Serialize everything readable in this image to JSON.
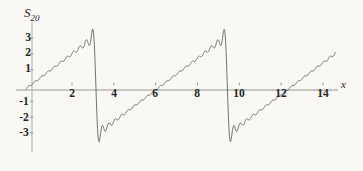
{
  "figure": {
    "background_color": "#f9f8f5",
    "curve_color": "#5a5a5a",
    "axis_color": "#8d8d8d",
    "y_axis_title_main": "S",
    "y_axis_title_sub": "20",
    "x_axis_title": "x"
  },
  "chart_data": {
    "type": "line",
    "title": "",
    "subtitle": "",
    "xlabel": "x",
    "ylabel": "S_20",
    "xlim": [
      -0.35,
      14.9
    ],
    "ylim": [
      -3.9,
      3.95
    ],
    "grid": false,
    "legend": null,
    "x_ticks": [
      2,
      4,
      6,
      8,
      10,
      12,
      14
    ],
    "x_tick_labels": [
      "2",
      "4",
      "6",
      "8",
      "10",
      "12",
      "14"
    ],
    "y_ticks": [
      3,
      2,
      1,
      -1,
      -2,
      -3
    ],
    "y_tick_labels": [
      "3",
      "2",
      "1",
      "-1",
      "-2",
      "-3"
    ],
    "formula": "S_20(x) = 2 * sum_{n=1}^{20} ((-1)^(n+1) / n) * sin(n x)",
    "n_terms": 20,
    "period": 6.283185307179586,
    "jump_discontinuities": [
      3.141592653589793,
      9.42477796076938
    ],
    "rise_discontinuities": [
      6.283185307179586,
      12.566370614359172
    ],
    "gibbs_overshoot_max": 3.52,
    "gibbs_undershoot_min": -3.52,
    "sawtooth_peak_value": 3.14,
    "series": [
      {
        "name": "S_20(x)",
        "color": "#5a5a5a",
        "x_start": -0.2,
        "x_end": 14.6,
        "samples": 1480
      }
    ]
  },
  "labels": {
    "y": [
      {
        "text": "3",
        "value": 3,
        "x_px": 28,
        "y_px": 38
      },
      {
        "text": "2",
        "value": 2,
        "x_px": 28,
        "y_px": 53
      },
      {
        "text": "1",
        "value": 1,
        "x_px": 28,
        "y_px": 69
      },
      {
        "text": "-1",
        "value": -1,
        "x_px": 24,
        "y_px": 102
      },
      {
        "text": "-2",
        "value": -2,
        "x_px": 24,
        "y_px": 118
      },
      {
        "text": "-3",
        "value": -3,
        "x_px": 24,
        "y_px": 133
      }
    ],
    "x": [
      {
        "text": "2",
        "value": 2,
        "x_px": 72,
        "y_px": 94
      },
      {
        "text": "4",
        "value": 4,
        "x_px": 114,
        "y_px": 94
      },
      {
        "text": "6",
        "value": 6,
        "x_px": 155,
        "y_px": 94
      },
      {
        "text": "8",
        "value": 8,
        "x_px": 197,
        "y_px": 94
      },
      {
        "text": "10",
        "value": 10,
        "x_px": 239,
        "y_px": 94
      },
      {
        "text": "12",
        "value": 12,
        "x_px": 281,
        "y_px": 94
      },
      {
        "text": "14",
        "value": 14,
        "x_px": 323,
        "y_px": 94
      }
    ]
  }
}
